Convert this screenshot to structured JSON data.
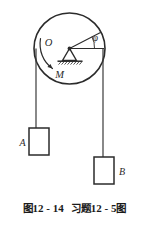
{
  "figure": {
    "caption": {
      "figure_word": "图",
      "figure_number": "12 - 14",
      "problem_word": "习题",
      "problem_number": "12 - 5",
      "trailing_word": "图",
      "full_text": "图 12 - 14　习题 12 - 5 图"
    },
    "diagram": {
      "type": "pulley-two-blocks-free-body",
      "pulley": {
        "label_center": "O",
        "label_moment": "M",
        "label_angle": "φ",
        "center_x": 69.5,
        "center_y": 48.5,
        "radius": 35.5
      },
      "blocks": [
        {
          "label": "A",
          "x": 29,
          "y": 128,
          "width": 20,
          "height": 27,
          "label_side": "left"
        },
        {
          "label": "B",
          "x": 94,
          "y": 157,
          "width": 20,
          "height": 27,
          "label_side": "right"
        }
      ],
      "ropes": [
        {
          "name": "left-rope",
          "x": 36,
          "y_top": 48.5,
          "y_bottom": 128
        },
        {
          "name": "right-rope",
          "x": 103,
          "y_top": 48.5,
          "y_bottom": 157
        }
      ],
      "colors": {
        "stroke": "#2b2b2b",
        "ink": "#1a1a1a",
        "background": "#ffffff"
      }
    }
  }
}
